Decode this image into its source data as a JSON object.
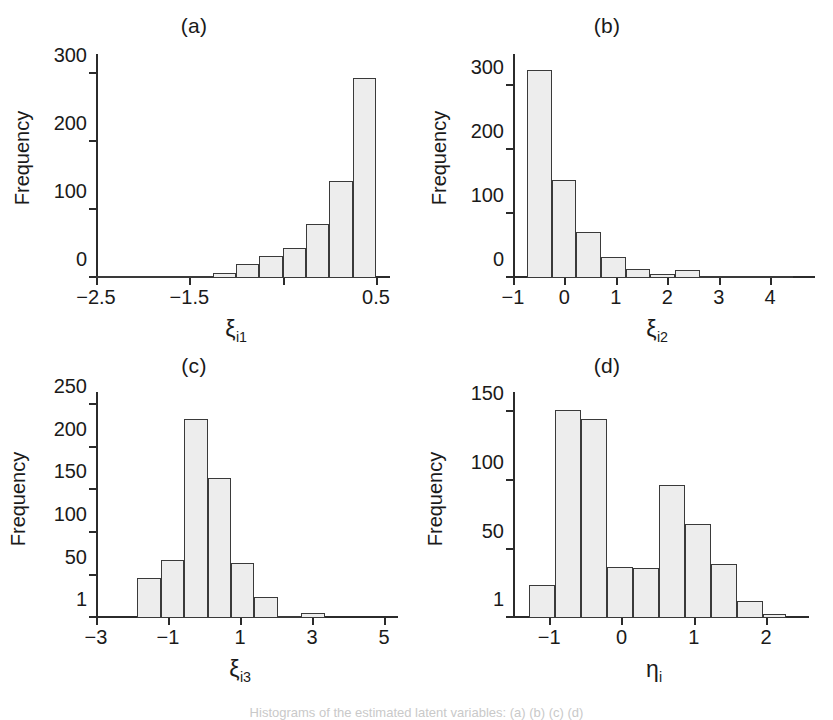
{
  "figure": {
    "caption_fragment": "Histograms of the estimated latent variables: (a) (b) (c) (d)"
  },
  "chart_data": [
    {
      "type": "bar",
      "title": "(a)",
      "xlabel": "ξ_i1",
      "xlabel_base": "ξ",
      "xlabel_sub": "i1",
      "ylabel": "Frequency",
      "xlim": [
        -2.5,
        0.5
      ],
      "ylim": [
        0,
        320
      ],
      "xticks": [
        -2.5,
        -1.5,
        0.5
      ],
      "xtick_labels": [
        "−2.5",
        "−1.5",
        "0.5"
      ],
      "xticks_minor": [
        -0.5
      ],
      "yticks": [
        0,
        100,
        200,
        300
      ],
      "ytick_labels": [
        "0",
        "100",
        "200",
        "300"
      ],
      "grid": false,
      "bin_edges": [
        -2.5,
        -2.25,
        -2.0,
        -1.75,
        -1.5,
        -1.25,
        -1.0,
        -0.75,
        -0.5,
        -0.25,
        0.0,
        0.25,
        0.5
      ],
      "bin_centers": [
        -2.375,
        -2.125,
        -1.875,
        -1.625,
        -1.375,
        -1.125,
        -0.875,
        -0.625,
        -0.375,
        -0.125,
        0.125,
        0.375
      ],
      "values": [
        0,
        0,
        0,
        1,
        2,
        8,
        21,
        33,
        44,
        79,
        143,
        294
      ]
    },
    {
      "type": "bar",
      "title": "(b)",
      "xlabel": "ξ_i2",
      "xlabel_base": "ξ",
      "xlabel_sub": "i2",
      "ylabel": "Frequency",
      "xlim": [
        -1.0,
        4.6
      ],
      "ylim": [
        0,
        340
      ],
      "xticks": [
        -1,
        0,
        1,
        2,
        3,
        4
      ],
      "xtick_labels": [
        "−1",
        "0",
        "1",
        "2",
        "3",
        "4"
      ],
      "yticks": [
        0,
        100,
        200,
        300
      ],
      "ytick_labels": [
        "0",
        "100",
        "200",
        "300"
      ],
      "grid": false,
      "bin_edges": [
        -0.73,
        -0.25,
        0.23,
        0.71,
        1.19,
        1.67,
        2.15,
        2.63,
        3.11,
        3.59,
        4.07,
        4.45
      ],
      "bin_centers": [
        -0.49,
        -0.01,
        0.47,
        0.95,
        1.43,
        1.91,
        2.39,
        2.87,
        3.35,
        3.83,
        4.26
      ],
      "values": [
        324,
        153,
        72,
        33,
        14,
        7,
        12,
        1,
        0,
        3,
        3
      ]
    },
    {
      "type": "bar",
      "title": "(c)",
      "xlabel": "ξ_i3",
      "xlabel_base": "ξ",
      "xlabel_sub": "i3",
      "ylabel": "Frequency",
      "xlim": [
        -3,
        5
      ],
      "ylim": [
        1,
        258
      ],
      "xticks": [
        -3,
        -1,
        1,
        3,
        5
      ],
      "xtick_labels": [
        "−3",
        "−1",
        "1",
        "3",
        "5"
      ],
      "yticks": [
        1,
        50,
        100,
        150,
        200,
        250
      ],
      "ytick_labels": [
        "1",
        "50",
        "100",
        "150",
        "200",
        "250"
      ],
      "grid": false,
      "bin_edges": [
        -1.85,
        -1.2,
        -0.55,
        0.1,
        0.75,
        1.4,
        2.05,
        2.7,
        3.35
      ],
      "bin_centers": [
        -1.525,
        -0.875,
        -0.225,
        0.425,
        1.075,
        1.725,
        2.375,
        3.025
      ],
      "values": [
        48,
        69,
        234,
        165,
        65,
        25,
        1,
        7
      ]
    },
    {
      "type": "bar",
      "title": "(d)",
      "xlabel": "η_i",
      "xlabel_base": "η",
      "xlabel_sub": "i",
      "ylabel": "Frequency",
      "xlim": [
        -1.5,
        2.4
      ],
      "ylim": [
        1,
        160
      ],
      "xticks": [
        -1,
        0,
        1,
        2
      ],
      "xtick_labels": [
        "−1",
        "0",
        "1",
        "2"
      ],
      "yticks": [
        1,
        50,
        100,
        150
      ],
      "ytick_labels": [
        "1",
        "50",
        "100",
        "150"
      ],
      "grid": false,
      "bin_edges": [
        -1.28,
        -0.92,
        -0.56,
        -0.2,
        0.16,
        0.52,
        0.88,
        1.24,
        1.6,
        1.96,
        2.28
      ],
      "bin_centers": [
        -1.1,
        -0.74,
        -0.38,
        -0.02,
        0.34,
        0.7,
        1.06,
        1.42,
        1.78,
        2.12
      ],
      "values": [
        25,
        151,
        145,
        38,
        37,
        97,
        69,
        40,
        13,
        4
      ]
    }
  ]
}
